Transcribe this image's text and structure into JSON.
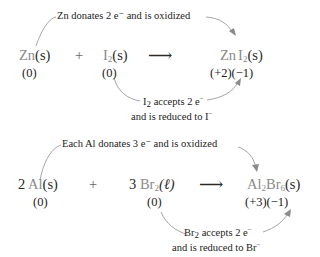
{
  "reaction1": {
    "top_note": "Zn donates 2 e⁻ and is oxidized",
    "reactant1": {
      "symbol": "Zn",
      "state": "(s)",
      "oxidation": "(0)"
    },
    "plus": "+",
    "reactant2": {
      "symbol": "I",
      "sub": "2",
      "state": "(s)",
      "oxidation": "(0)"
    },
    "arrow": "⟶",
    "product": {
      "symbol1": "Zn",
      "symbol2": "I",
      "sub": "2",
      "state": "(s)",
      "oxidation": "(+2)(−1)"
    },
    "bottom_note_line1_symbol": "I",
    "bottom_note_line1_sub": "2",
    "bottom_note_line1_text": " accepts 2 e",
    "bottom_note_line1_sup": "−",
    "bottom_note_line2_text": "and is reduced to I",
    "bottom_note_line2_sup": "−"
  },
  "reaction2": {
    "top_note": "Each Al donates 3 e⁻ and is oxidized",
    "reactant1": {
      "coef": "2",
      "symbol": "Al",
      "state": "(s)",
      "oxidation": "(0)"
    },
    "plus": "+",
    "reactant2": {
      "coef": "3",
      "symbol": "Br",
      "sub": "2",
      "state": "(ℓ)",
      "oxidation": "(0)"
    },
    "arrow": "⟶",
    "product": {
      "symbol1": "Al",
      "sub1": "2",
      "symbol2": "Br",
      "sub2": "6",
      "state": "(s)",
      "oxidation": "(+3)(−1)"
    },
    "bottom_note_line1_symbol": "Br",
    "bottom_note_line1_sub": "2",
    "bottom_note_line1_text": " accepts 2 e",
    "bottom_note_line1_sup": "−",
    "bottom_note_line2_text": "and is reduced to Br",
    "bottom_note_line2_sup": "−"
  }
}
